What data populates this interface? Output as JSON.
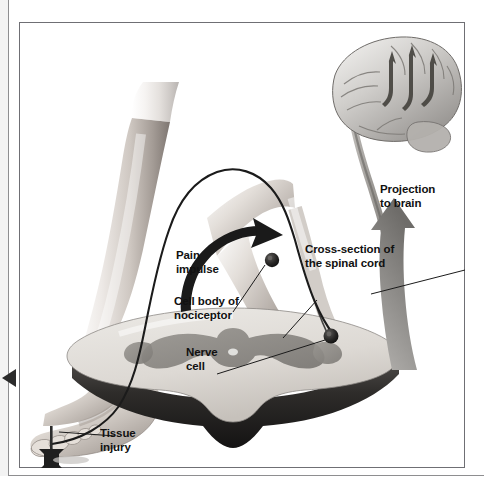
{
  "figure": {
    "type": "anatomical-diagram",
    "frame_color": "#6f6f74",
    "ink_color": "#111111",
    "palette": {
      "skin_light": "#f0ece9",
      "skin_mid": "#c9c2bd",
      "skin_dark": "#8d8681",
      "gray_matter": "#8e8e8e",
      "white_matter": "#d8d6d2",
      "cord_edge": "#3a3a3a",
      "arrow_gray": "#8c8c8c",
      "arrow_black": "#1a1a1a"
    }
  },
  "labels": [
    {
      "id": "pain-impulse",
      "text": "Pain\nimpulse",
      "has_leader": false
    },
    {
      "id": "cell-body",
      "text": "Cell body of\nnociceptor",
      "has_leader": true
    },
    {
      "id": "nerve-cell",
      "text": "Nerve\ncell",
      "has_leader": true
    },
    {
      "id": "cross-section",
      "text": "Cross-section of\nthe spinal cord",
      "has_leader": true
    },
    {
      "id": "projection",
      "text": "Projection\nto brain",
      "has_leader": false
    },
    {
      "id": "tissue-injury",
      "text": "Tissue\ninjury",
      "has_leader": true
    }
  ],
  "anatomy": {
    "brain": "lateral view of cerebrum with brainstem, cortical arrows pointing up",
    "spinal_cord": "transverse cross-section showing butterfly-shaped gray matter",
    "leg": "lower leg and foot, lateral view, with nerve fiber tracing to the great toe",
    "nociceptor_cell_body": "dark round dorsal root ganglion cell on the nerve",
    "injury_object": "tack pressed against the great toe"
  },
  "markers": {
    "edge_triangle": "left-edge page marker triangle"
  }
}
